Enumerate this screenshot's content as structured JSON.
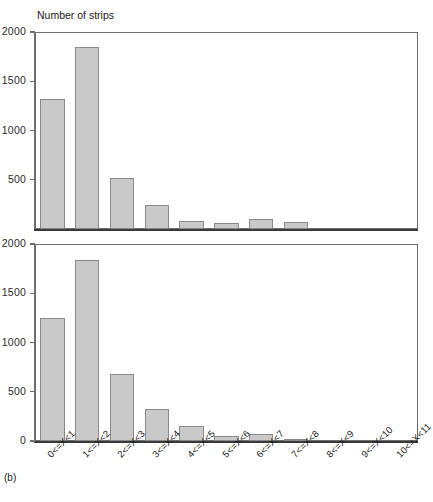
{
  "figure": {
    "panel_letter": "(b)",
    "axis_title": "Number of strips",
    "bar_fill": "#c9c9c9",
    "bar_stroke": "#8a8a8a",
    "axis_color": "#6e6e6e",
    "background": "#ffffff"
  },
  "chart_data": [
    {
      "type": "bar",
      "id": "top-histogram",
      "title": "Number of strips",
      "xlabel": "",
      "ylabel": "Number of strips",
      "ylim": [
        0,
        2000
      ],
      "grid": false,
      "legend": "none",
      "ytick_labels": [
        "500",
        "1000",
        "1500",
        "2000"
      ],
      "yticks": [
        500,
        1000,
        1500,
        2000
      ],
      "categories": [
        "0<=X<1",
        "1<=X<2",
        "2<=X<3",
        "3<=X<4",
        "4<=X<5",
        "5<=X<6",
        "6<=X<7",
        "7<=X<8",
        "8<=X<9",
        "9<=X<10",
        "10<=X<11"
      ],
      "values": [
        1320,
        1850,
        520,
        240,
        85,
        65,
        100,
        70,
        0,
        0,
        0
      ]
    },
    {
      "type": "bar",
      "id": "bottom-histogram",
      "title": "",
      "xlabel": "",
      "ylabel": "Number of strips",
      "ylim": [
        0,
        2000
      ],
      "grid": false,
      "legend": "none",
      "ytick_labels": [
        "0",
        "500",
        "1000",
        "1500",
        "2000"
      ],
      "yticks": [
        0,
        500,
        1000,
        1500,
        2000
      ],
      "categories": [
        "0<=X<1",
        "1<=X<2",
        "2<=X<3",
        "3<=X<4",
        "4<=X<5",
        "5<=X<6",
        "6<=X<7",
        "7<=X<8",
        "8<=X<9",
        "9<=X<10",
        "10<=X<11"
      ],
      "values": [
        1250,
        1840,
        680,
        320,
        155,
        55,
        75,
        20,
        0,
        0,
        0
      ]
    }
  ]
}
